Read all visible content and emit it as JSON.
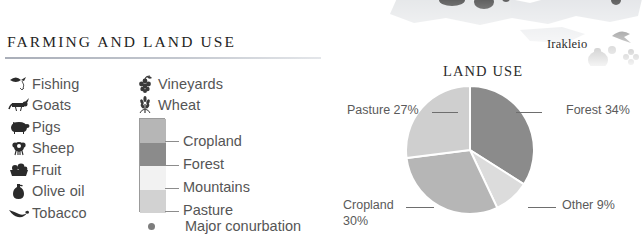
{
  "panel": {
    "title": "FARMING AND LAND USE"
  },
  "map": {
    "city_label": "Irakleio",
    "icons": [
      "fish-icon",
      "grapes-icon",
      "olive-oil-icon",
      "conurbation-dot-icon"
    ]
  },
  "legend": {
    "column_a": [
      {
        "icon": "fishing-icon",
        "label": "Fishing"
      },
      {
        "icon": "goat-icon",
        "label": "Goats"
      },
      {
        "icon": "pig-icon",
        "label": "Pigs"
      },
      {
        "icon": "sheep-icon",
        "label": "Sheep"
      },
      {
        "icon": "fruit-icon",
        "label": "Fruit"
      },
      {
        "icon": "olive-oil-icon",
        "label": "Olive oil"
      },
      {
        "icon": "tobacco-icon",
        "label": "Tobacco"
      }
    ],
    "column_b": [
      {
        "icon": "vineyards-icon",
        "label": "Vineyards"
      },
      {
        "icon": "wheat-icon",
        "label": "Wheat"
      }
    ],
    "swatches": [
      {
        "label": "Cropland",
        "color": "#b6b6b6"
      },
      {
        "label": "Forest",
        "color": "#8b8b8b"
      },
      {
        "label": "Mountains",
        "color": "#f2f2f2"
      },
      {
        "label": "Pasture",
        "color": "#d2d2d2"
      }
    ],
    "conurbation": {
      "icon": "conurbation-dot-icon",
      "label": "Major conurbation",
      "color": "#7d7d7d"
    }
  },
  "chart_data": {
    "type": "pie",
    "title": "LAND USE",
    "categories": [
      "Forest",
      "Other",
      "Cropland",
      "Pasture"
    ],
    "values": [
      34,
      9,
      30,
      27
    ],
    "labels": [
      "Forest 34%",
      "Other 9%",
      "Cropland 30%",
      "Pasture 27%"
    ],
    "colors": [
      "#8b8b8b",
      "#dcdcdc",
      "#b6b6b6",
      "#cfcfcf"
    ],
    "start_angle_deg": 0,
    "direction": "clockwise",
    "legend": "labels-with-leader-lines",
    "grid": false,
    "xlabel": "",
    "ylabel": ""
  },
  "chart_labels": {
    "pasture": "Pasture 27%",
    "forest": "Forest 34%",
    "cropland_line1": "Cropland",
    "cropland_line2": "30%",
    "other": "Other 9%"
  }
}
